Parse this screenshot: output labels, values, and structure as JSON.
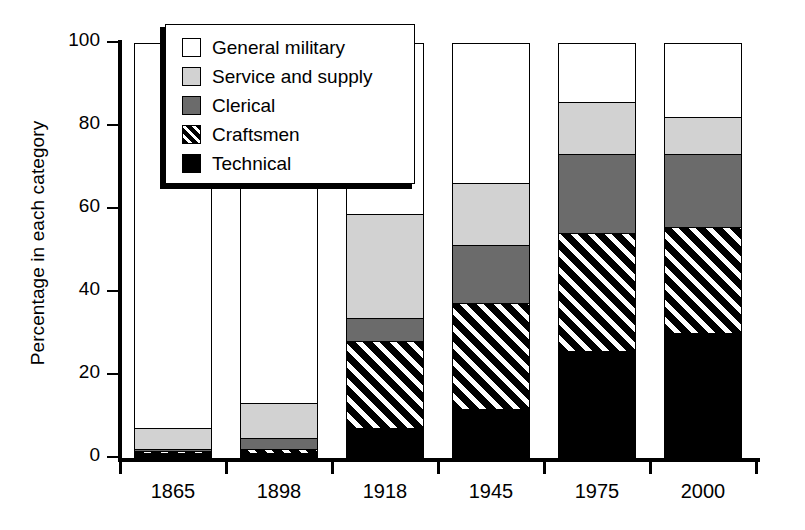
{
  "chart_data": {
    "type": "bar",
    "subtype": "stacked-bar-100-percent",
    "title": "",
    "xlabel": "",
    "ylabel": "Percentage in each category",
    "ylim": [
      0,
      100
    ],
    "yticks": [
      0,
      20,
      40,
      60,
      80,
      100
    ],
    "ytick_labels": [
      "0",
      "20",
      "40",
      "60",
      "80",
      "100"
    ],
    "grid": false,
    "legend_position": "upper-left-inside",
    "categories": [
      "1865",
      "1898",
      "1918",
      "1945",
      "1975",
      "2000"
    ],
    "series": [
      {
        "name": "Technical",
        "color": "#000000",
        "pattern": "solid",
        "values": [
          1.0,
          1.0,
          7.0,
          11.5,
          25.5,
          30.0
        ]
      },
      {
        "name": "Craftsmen",
        "color": "#000000",
        "pattern": "diagonal-hatch",
        "values": [
          0.5,
          1.0,
          21.0,
          25.5,
          28.5,
          25.5
        ]
      },
      {
        "name": "Clerical",
        "color": "#6b6b6b",
        "pattern": "solid",
        "values": [
          0.5,
          2.5,
          5.5,
          14.0,
          19.0,
          17.5
        ]
      },
      {
        "name": "Service and supply",
        "color": "#d2d2d2",
        "pattern": "solid",
        "values": [
          5.0,
          8.5,
          25.0,
          15.0,
          12.5,
          9.0
        ]
      },
      {
        "name": "General military",
        "color": "#ffffff",
        "pattern": "solid",
        "values": [
          93.0,
          87.0,
          41.5,
          34.0,
          14.5,
          18.0
        ]
      }
    ],
    "cumulative_tops": {
      "1865": {
        "technical": 1.0,
        "craftsmen": 1.5,
        "clerical": 2.0,
        "service": 7.0,
        "general": 100
      },
      "1898": {
        "technical": 1.0,
        "craftsmen": 2.0,
        "clerical": 4.5,
        "service": 13.0,
        "general": 100
      },
      "1918": {
        "technical": 7.0,
        "craftsmen": 28.0,
        "clerical": 33.5,
        "service": 58.5,
        "general": 100
      },
      "1945": {
        "technical": 11.5,
        "craftsmen": 37.0,
        "clerical": 51.0,
        "service": 66.0,
        "general": 100
      },
      "1975": {
        "technical": 25.5,
        "craftsmen": 54.0,
        "clerical": 73.0,
        "service": 85.5,
        "general": 100
      },
      "2000": {
        "technical": 30.0,
        "craftsmen": 55.5,
        "clerical": 73.0,
        "service": 82.0,
        "general": 100
      }
    }
  },
  "axes": {
    "y_title": "Percentage in each category",
    "y_ticks": [
      {
        "value": 100,
        "label": "100"
      },
      {
        "value": 80,
        "label": "80"
      },
      {
        "value": 60,
        "label": "60"
      },
      {
        "value": 40,
        "label": "40"
      },
      {
        "value": 20,
        "label": "20"
      },
      {
        "value": 0,
        "label": "0"
      }
    ],
    "x_ticks": [
      {
        "label": "1865"
      },
      {
        "label": "1898"
      },
      {
        "label": "1918"
      },
      {
        "label": "1945"
      },
      {
        "label": "1975"
      },
      {
        "label": "2000"
      }
    ]
  },
  "legend": {
    "items": [
      {
        "label": "General military",
        "swatch": "white-square",
        "color": "#ffffff"
      },
      {
        "label": "Service and supply",
        "swatch": "light-gray-square",
        "color": "#d2d2d2"
      },
      {
        "label": "Clerical",
        "swatch": "dark-gray-square",
        "color": "#6b6b6b"
      },
      {
        "label": "Craftsmen",
        "swatch": "hatched-black-square",
        "color": "#000000"
      },
      {
        "label": "Technical",
        "swatch": "black-square",
        "color": "#000000"
      }
    ]
  }
}
